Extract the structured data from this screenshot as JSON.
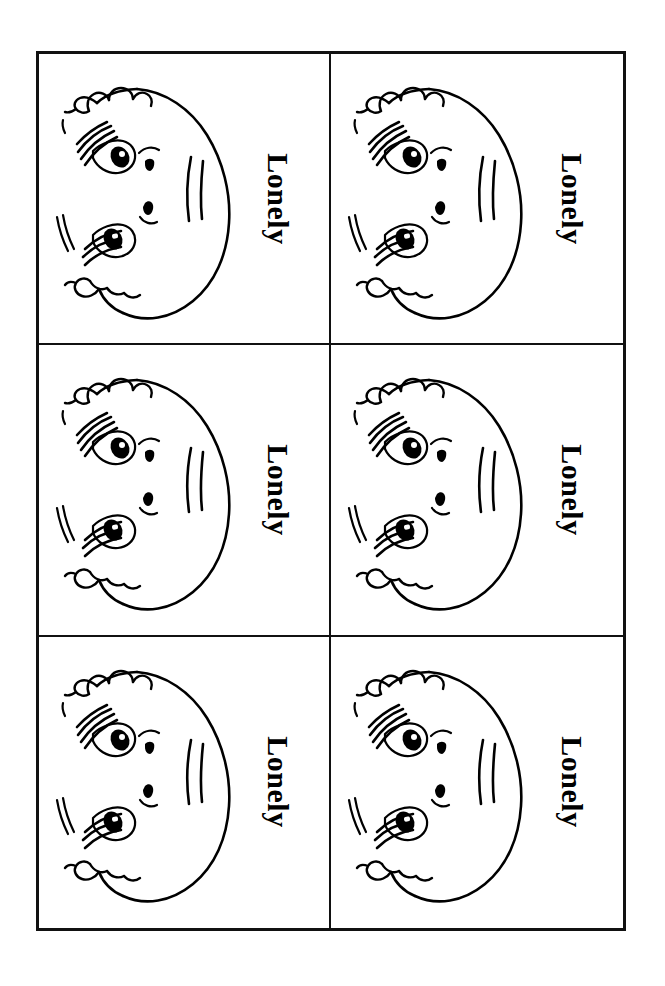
{
  "sheet": {
    "title": "Lonely emotion flashcard sheet",
    "rows": 3,
    "columns": 2,
    "total_cards": 6,
    "border_color": "#111111",
    "background_color": "#ffffff",
    "ink_color": "#000000"
  },
  "cards": [
    {
      "id": "card-1",
      "caption": "Lonely",
      "art": "lonely-face-line-drawing",
      "rotation_degrees": 90
    },
    {
      "id": "card-2",
      "caption": "Lonely",
      "art": "lonely-face-line-drawing",
      "rotation_degrees": 90
    },
    {
      "id": "card-3",
      "caption": "Lonely",
      "art": "lonely-face-line-drawing",
      "rotation_degrees": 90
    },
    {
      "id": "card-4",
      "caption": "Lonely",
      "art": "lonely-face-line-drawing",
      "rotation_degrees": 90
    },
    {
      "id": "card-5",
      "caption": "Lonely",
      "art": "lonely-face-line-drawing",
      "rotation_degrees": 90
    },
    {
      "id": "card-6",
      "caption": "Lonely",
      "art": "lonely-face-line-drawing",
      "rotation_degrees": 90
    }
  ]
}
